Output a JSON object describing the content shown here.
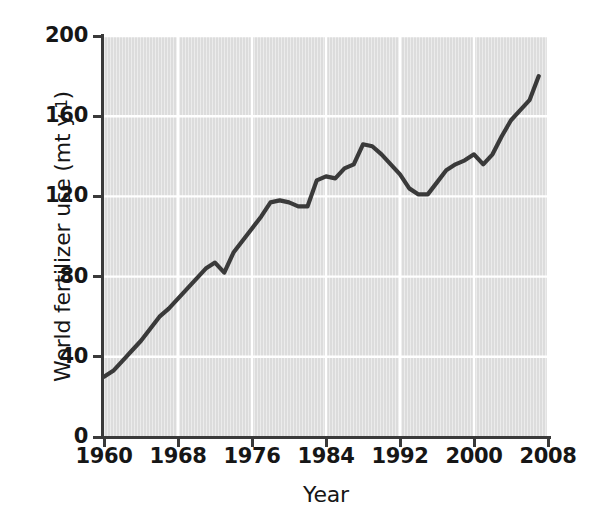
{
  "chart_data": {
    "type": "line",
    "title": "",
    "subtitle": "",
    "xlabel": "Year",
    "ylabel": "World fertilizer use (mt y⁻¹)",
    "ylabel_main": "World fertilizer use (mt y",
    "ylabel_exp": "-1",
    "ylabel_tail": ")",
    "xlim": [
      1960,
      2008
    ],
    "ylim": [
      0,
      200
    ],
    "grid": true,
    "grid_color": "#ffffff",
    "plot_background": "#dcdcdc",
    "line_color": "#3a3a3a",
    "legend": null,
    "legend_position": "none",
    "xticks": [
      1960,
      1968,
      1976,
      1984,
      1992,
      2000,
      2008
    ],
    "xtick_labels": [
      "1960",
      "1968",
      "1976",
      "1984",
      "1992",
      "2000",
      "2008"
    ],
    "yticks": [
      0,
      40,
      80,
      120,
      160,
      200
    ],
    "ytick_labels": [
      "0",
      "40",
      "80",
      "120",
      "160",
      "200"
    ],
    "x": [
      1960,
      1961,
      1962,
      1963,
      1964,
      1965,
      1966,
      1967,
      1968,
      1969,
      1970,
      1971,
      1972,
      1973,
      1974,
      1975,
      1976,
      1977,
      1978,
      1979,
      1980,
      1981,
      1982,
      1983,
      1984,
      1985,
      1986,
      1987,
      1988,
      1989,
      1990,
      1991,
      1992,
      1993,
      1994,
      1995,
      1996,
      1997,
      1998,
      1999,
      2000,
      2001,
      2002,
      2003,
      2004,
      2005,
      2006,
      2007
    ],
    "y": [
      30,
      33,
      38,
      43,
      48,
      54,
      60,
      64,
      69,
      74,
      79,
      84,
      87,
      82,
      92,
      98,
      104,
      110,
      117,
      118,
      117,
      115,
      115,
      128,
      130,
      129,
      134,
      136,
      146,
      145,
      141,
      136,
      131,
      124,
      121,
      121,
      127,
      133,
      136,
      138,
      141,
      136,
      141,
      150,
      158,
      163,
      168,
      180
    ],
    "series": [
      {
        "name": "World fertilizer use",
        "units": "mt y-1",
        "values": [
          30,
          33,
          38,
          43,
          48,
          54,
          60,
          64,
          69,
          74,
          79,
          84,
          87,
          82,
          92,
          98,
          104,
          110,
          117,
          118,
          117,
          115,
          115,
          128,
          130,
          129,
          134,
          136,
          146,
          145,
          141,
          136,
          131,
          124,
          121,
          121,
          127,
          133,
          136,
          138,
          141,
          136,
          141,
          150,
          158,
          163,
          168,
          180
        ]
      }
    ],
    "annotations": []
  }
}
